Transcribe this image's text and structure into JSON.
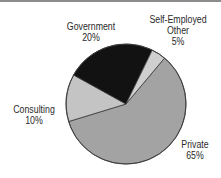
{
  "chart_data": {
    "type": "pie",
    "title": "",
    "categories": [
      "Private",
      "Consulting",
      "Government",
      "Self-Employed Other"
    ],
    "values": [
      65,
      10,
      20,
      5
    ],
    "unit": "%",
    "slices": [
      {
        "name": "Private",
        "value": 65,
        "label_line1": "Private",
        "label_line2": "65%",
        "color": "#a3a3a3",
        "start_deg": 197,
        "end_deg": 410
      },
      {
        "name": "Consulting",
        "value": 10,
        "label_line1": "Consulting",
        "label_line2": "10%",
        "color": "#c4c4c4",
        "start_deg": 151,
        "end_deg": 197
      },
      {
        "name": "Government",
        "value": 20,
        "label_line1": "Government",
        "label_line2": "20%",
        "color": "#121212",
        "start_deg": 64,
        "end_deg": 151
      },
      {
        "name": "Self-Employed Other",
        "value": 5,
        "label_line1": "Self-Employed",
        "label_line2": "Other",
        "label_line3": "5%",
        "color": "#cfcfcf",
        "start_deg": 50,
        "end_deg": 64
      }
    ],
    "legend": "none (direct labels)",
    "center": [
      126,
      104
    ],
    "radius": 60
  },
  "labels": {
    "private": {
      "line1": "Private",
      "line2": "65%"
    },
    "consulting": {
      "line1": "Consulting",
      "line2": "10%"
    },
    "government": {
      "line1": "Government",
      "line2": "20%"
    },
    "self_employed": {
      "line1": "Self-Employed",
      "line2": "Other",
      "line3": "5%"
    }
  }
}
